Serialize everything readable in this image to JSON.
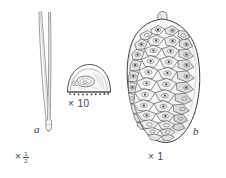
{
  "plate": {
    "title": "Pine needles, seed scale and cone",
    "background_color": "#ffffff",
    "ink_color": "#3a3a3a"
  },
  "figures": [
    {
      "key": "needles",
      "name": "needle-pair",
      "caption": "a",
      "scale_text": "×",
      "scale_fraction_numerator": "1",
      "scale_fraction_denominator": "2",
      "description": "Pair of long slender pine needles joined at a basal sheath"
    },
    {
      "key": "scale_detail",
      "name": "seed-scale-detail",
      "caption": "",
      "scale_text": "× 10",
      "description": "Half-dome seed scale with central oval umbo and fringed base, magnified ten times"
    },
    {
      "key": "cone",
      "name": "pine-cone",
      "caption": "b",
      "scale_text": "× 1",
      "description": "Ovoid pine cone with overlapping rhomboid scales at natural size"
    }
  ],
  "labels": {
    "needle_caption": "a",
    "cone_caption": "b",
    "needle_scale_mult": "×",
    "needle_scale_num": "1",
    "needle_scale_den": "2",
    "dome_scale": "× 10",
    "cone_scale": "× 1"
  }
}
